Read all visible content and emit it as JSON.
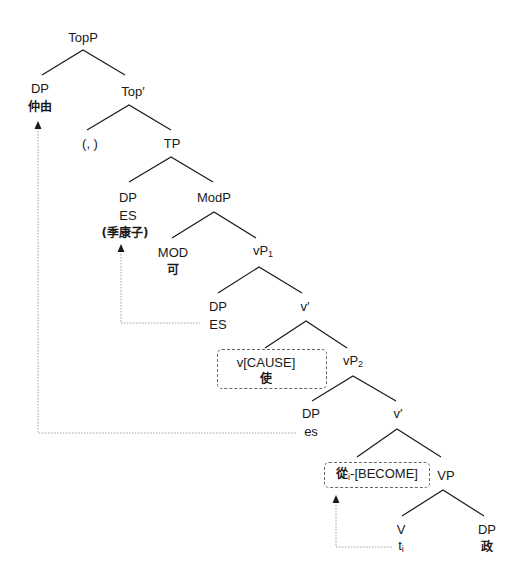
{
  "diagram": {
    "type": "syntax-tree",
    "nodes": {
      "topp": "TopP",
      "dp_top": "DP",
      "dp_top_word": "仲由",
      "top_bar": "Top′",
      "comma": "(,   )",
      "tp": "TP",
      "dp_tp": "DP",
      "dp_tp_es": "ES",
      "dp_tp_word": "(季康子)",
      "modp": "ModP",
      "mod": "MOD",
      "mod_word": "可",
      "vp1": "vP",
      "vp1_sub": "1",
      "dp_vp1": "DP",
      "dp_vp1_es": "ES",
      "v_bar1": "v′",
      "v_cause": "v[CAUSE]",
      "v_cause_word": "使",
      "vp2": "vP",
      "vp2_sub": "2",
      "dp_vp2": "DP",
      "dp_vp2_es": "es",
      "v_bar2": "v′",
      "v_become_word": "從",
      "v_become_index": "i",
      "v_become": "-[BECOME]",
      "vp": "VP",
      "v": "V",
      "trace": "t",
      "trace_index": "i",
      "dp_obj": "DP",
      "dp_obj_word": "政"
    },
    "movement_arrows": [
      {
        "from": "DP es",
        "to": "DP 仲由"
      },
      {
        "from": "DP ES (vP1)",
        "to": "DP ES (季康子)"
      },
      {
        "from": "V t_i",
        "to": "從_i-[BECOME]"
      }
    ],
    "colors": {
      "line": "#1a1a1a",
      "dotted": "#999999",
      "dashed_box": "#666666"
    }
  }
}
